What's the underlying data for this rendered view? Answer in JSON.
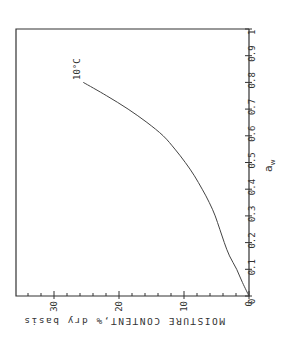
{
  "chart_data": {
    "type": "line",
    "title": "",
    "orientation": "rotated 90 degrees (x-axis runs vertically on right edge, y-axis runs horizontally along bottom)",
    "xlabel": "a_w",
    "ylabel": "MOISTURE CONTENT,% dry basis",
    "xlim": [
      0,
      1
    ],
    "ylim": [
      0,
      35
    ],
    "x_ticks": [
      "0",
      "0.1",
      "0.2",
      "0.3",
      "0.4",
      "0.5",
      "0.6",
      "0.7",
      "0.8",
      "0.9",
      "1"
    ],
    "y_ticks": [
      "0",
      "10",
      "20",
      "30"
    ],
    "y_minor_tick_step": 2,
    "grid": false,
    "legend": null,
    "series": [
      {
        "name": "10°C",
        "x": [
          0.0,
          0.05,
          0.1,
          0.15,
          0.2,
          0.25,
          0.3,
          0.35,
          0.4,
          0.45,
          0.5,
          0.55,
          0.6,
          0.65,
          0.7,
          0.75,
          0.8
        ],
        "values": [
          0.0,
          1.0,
          1.9,
          3.0,
          3.8,
          4.5,
          5.2,
          6.1,
          7.2,
          8.4,
          9.8,
          11.4,
          13.2,
          15.7,
          18.6,
          21.9,
          25.5
        ]
      }
    ],
    "annotations": [
      {
        "text": "10°C",
        "x": 0.82,
        "y": 25.5
      }
    ]
  },
  "labels": {
    "xlabel_main": "a",
    "xlabel_sub": "w",
    "ylabel": "MOISTURE CONTENT,% dry basis",
    "curve_label": "10°C"
  }
}
